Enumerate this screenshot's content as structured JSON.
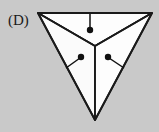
{
  "figure": {
    "label": "(D)",
    "colors": {
      "background": "#c9c9c9",
      "facet_fill": "#fdfdfd",
      "outline": "#1a1a1a",
      "arrow": "#111111"
    },
    "shape": {
      "name": "inverted-triangle",
      "outer_vertices": [
        {
          "name": "top-left",
          "x": 38,
          "y": 13
        },
        {
          "name": "top-right",
          "x": 152,
          "y": 13
        },
        {
          "name": "bottom",
          "x": 95,
          "y": 120
        }
      ],
      "center_vertex": {
        "name": "apex",
        "x": 95,
        "y": 46
      },
      "facets": [
        {
          "name": "top-facet",
          "points": "38,13 152,13 95,46"
        },
        {
          "name": "left-facet",
          "points": "38,13 95,46 95,120"
        },
        {
          "name": "right-facet",
          "points": "152,13 95,46 95,120"
        }
      ]
    },
    "arrows": [
      {
        "name": "top-arrow",
        "tail_x": 90,
        "tail_y": 14,
        "head_x": 90,
        "head_y": 29,
        "dot_r": 3.2
      },
      {
        "name": "left-arrow",
        "tail_x": 66,
        "tail_y": 68,
        "head_x": 81,
        "head_y": 57,
        "dot_r": 3.2
      },
      {
        "name": "right-arrow",
        "tail_x": 124,
        "tail_y": 68,
        "head_x": 108,
        "head_y": 57,
        "dot_r": 3.2
      }
    ]
  }
}
